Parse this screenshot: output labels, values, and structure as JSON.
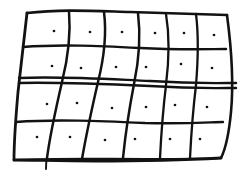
{
  "image": {
    "title": "Hand-drawn wavy grid",
    "description": "Rough ink sketch of a rectangular net / flag divided into 6 columns and 4 rows with a dot inside every cell",
    "width": 241,
    "height": 172,
    "background_color": "#ffffff",
    "ink_color": "#121212"
  },
  "chart_data": {
    "type": "scatter",
    "xlabel": "",
    "ylabel": "",
    "xlim": [
      0,
      241
    ],
    "ylim": [
      0,
      172
    ],
    "grid": true,
    "legend": "none",
    "grid_spec": {
      "columns": 6,
      "rows": 4,
      "cells": 24,
      "style": "hand-drawn wavy ink",
      "doubled_row_divider_index": 2,
      "overshoot_lines": [
        "middle horizontal divider overshoots the right edge",
        "first vertical divider overshoots the bottom edge"
      ]
    },
    "outline": {
      "top_left": [
        27,
        13
      ],
      "top_right": [
        227,
        15
      ],
      "bottom_right": [
        221,
        158
      ],
      "bottom_left": [
        14,
        160
      ]
    },
    "vertical_lines": [
      {
        "name": "v-left-edge",
        "top": [
          27,
          13
        ],
        "bottom": [
          14,
          160
        ]
      },
      {
        "name": "v1",
        "top": [
          69,
          11
        ],
        "bottom": [
          46,
          169
        ]
      },
      {
        "name": "v2",
        "top": [
          104,
          12
        ],
        "bottom": [
          82,
          159
        ]
      },
      {
        "name": "v3",
        "top": [
          138,
          13
        ],
        "bottom": [
          123,
          158
        ]
      },
      {
        "name": "v4",
        "top": [
          166,
          14
        ],
        "bottom": [
          160,
          158
        ]
      },
      {
        "name": "v5",
        "top": [
          196,
          14
        ],
        "bottom": [
          190,
          158
        ]
      },
      {
        "name": "v-right-edge",
        "top": [
          227,
          15
        ],
        "bottom": [
          221,
          158
        ]
      }
    ],
    "horizontal_lines": [
      {
        "name": "h-top-edge",
        "left": [
          27,
          13
        ],
        "right": [
          227,
          15
        ]
      },
      {
        "name": "h1",
        "left": [
          23,
          47
        ],
        "right": [
          226,
          49
        ]
      },
      {
        "name": "h2a",
        "left": [
          19,
          78
        ],
        "right": [
          236,
          83
        ]
      },
      {
        "name": "h2b",
        "left": [
          19,
          83
        ],
        "right": [
          236,
          88
        ]
      },
      {
        "name": "h3",
        "left": [
          16,
          122
        ],
        "right": [
          223,
          122
        ]
      },
      {
        "name": "h-bottom-edge",
        "left": [
          14,
          160
        ],
        "right": [
          221,
          158
        ]
      }
    ],
    "dots": [
      {
        "row": 1,
        "col": 1,
        "x": 54,
        "y": 31
      },
      {
        "row": 1,
        "col": 2,
        "x": 90,
        "y": 32
      },
      {
        "row": 1,
        "col": 3,
        "x": 122,
        "y": 32
      },
      {
        "row": 1,
        "col": 4,
        "x": 155,
        "y": 33
      },
      {
        "row": 1,
        "col": 5,
        "x": 184,
        "y": 33
      },
      {
        "row": 1,
        "col": 6,
        "x": 214,
        "y": 35
      },
      {
        "row": 2,
        "col": 1,
        "x": 52,
        "y": 66
      },
      {
        "row": 2,
        "col": 2,
        "x": 81,
        "y": 68
      },
      {
        "row": 2,
        "col": 3,
        "x": 116,
        "y": 67
      },
      {
        "row": 2,
        "col": 4,
        "x": 146,
        "y": 67
      },
      {
        "row": 2,
        "col": 5,
        "x": 181,
        "y": 64
      },
      {
        "row": 2,
        "col": 6,
        "x": 212,
        "y": 68
      },
      {
        "row": 3,
        "col": 1,
        "x": 47,
        "y": 104
      },
      {
        "row": 3,
        "col": 2,
        "x": 77,
        "y": 103
      },
      {
        "row": 3,
        "col": 3,
        "x": 112,
        "y": 108
      },
      {
        "row": 3,
        "col": 4,
        "x": 146,
        "y": 107
      },
      {
        "row": 3,
        "col": 5,
        "x": 175,
        "y": 105
      },
      {
        "row": 3,
        "col": 6,
        "x": 207,
        "y": 107
      },
      {
        "row": 4,
        "col": 1,
        "x": 37,
        "y": 137
      },
      {
        "row": 4,
        "col": 2,
        "x": 70,
        "y": 137
      },
      {
        "row": 4,
        "col": 3,
        "x": 105,
        "y": 140
      },
      {
        "row": 4,
        "col": 4,
        "x": 135,
        "y": 139
      },
      {
        "row": 4,
        "col": 5,
        "x": 170,
        "y": 139
      },
      {
        "row": 4,
        "col": 6,
        "x": 200,
        "y": 139
      }
    ]
  },
  "paths": {
    "outline_top": "M 27 13 C 60 9, 95 11, 130 12 C 165 13, 200 14, 227 15",
    "outline_right": "M 227 15 C 231 45, 234 80, 231 112 C 229 133, 226 148, 221 158",
    "outline_bottom": "M 221 158 C 185 160, 140 161, 95 161 C 60 161, 33 160, 14 160",
    "outline_left": "M 27 13 C 24 40, 21 66, 18 92 C 16 115, 14 140, 14 160",
    "v1": "M 69 11 C 71 35, 68 58, 62 82 C 56 108, 50 135, 47 158",
    "v1_tail": "M 47 158 C 46 162, 46 166, 46 169",
    "v2": "M 104 12 C 107 36, 104 58, 98 82 C 92 108, 86 136, 82 159",
    "v3": "M 138 13 C 141 37, 139 60, 134 84 C 129 110, 125 138, 123 158",
    "v4": "M 166 14 C 170 38, 169 61, 166 85 C 163 110, 161 138, 160 158",
    "v5": "M 196 14 C 199 38, 198 61, 196 85 C 193 110, 191 138, 190 158",
    "h1": "M 23 47 C 60 44, 100 46, 140 48 C 180 50, 210 49, 226 49",
    "h2a": "M 19 78 C 60 76, 105 79, 150 81 C 195 84, 222 83, 236 83",
    "h2b": "M 19 83 C 60 82, 105 84, 150 86 C 195 89, 222 88, 236 88",
    "h3": "M 16 122 C 55 119, 100 121, 145 123 C 190 124, 212 122, 223 122",
    "h_bottom_dup": "M 14 160 C 55 158, 100 159, 145 159 C 185 159, 208 159, 221 158"
  }
}
